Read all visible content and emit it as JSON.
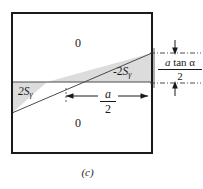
{
  "figure": {
    "caption": "(c)",
    "frame": {
      "name": "outer-square-border",
      "color": "#1a1a1a",
      "x": 12,
      "y": 13,
      "width": 140,
      "height": 140
    },
    "shading": {
      "fill_color": "#dcdcdc",
      "stroke_color": "#555555"
    },
    "regions": [
      {
        "id": "top",
        "label": "0",
        "x": 78,
        "y": 43
      },
      {
        "id": "bottom",
        "label": "0",
        "x": 78,
        "y": 123
      },
      {
        "id": "right-wedge",
        "label_prefix": "-2",
        "label_base": "S",
        "label_sub": "γ",
        "x": 113,
        "y": 72
      },
      {
        "id": "left-wedge",
        "label_prefix": "",
        "label_base": "2S",
        "label_sub": "γ",
        "x": 20,
        "y": 93
      }
    ],
    "dimensions": [
      {
        "id": "vertical-right",
        "numerator_italic": "a",
        "numerator_rest": " tan α",
        "denominator": "2",
        "arrow_direction": "inward",
        "guide_style": "dash-dot",
        "top_y": 53,
        "bottom_y": 83
      },
      {
        "id": "horizontal-center",
        "numerator_italic": "a",
        "denominator": "2",
        "arrow_direction": "outward",
        "left_x": 66,
        "right_x": 148,
        "y": 96
      }
    ],
    "geometry": {
      "diagonal_left_y": 113,
      "diagonal_right_y": 53,
      "midline_y": 82
    },
    "colors": {
      "ink": "#1a1a1a",
      "shade": "#dcdcdc",
      "guide": "#3a3a3a",
      "background": "#ffffff"
    }
  }
}
